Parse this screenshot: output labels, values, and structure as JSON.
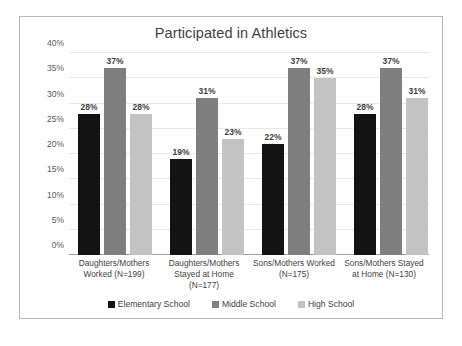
{
  "chart_data": {
    "type": "bar",
    "title": "Participated in Athletics",
    "xlabel": "",
    "ylabel": "",
    "ylim": [
      0,
      40
    ],
    "ytick_labels": [
      "40%",
      "35%",
      "30%",
      "25%",
      "20%",
      "15%",
      "10%",
      "5%",
      "0%"
    ],
    "ytick_values": [
      40,
      35,
      30,
      25,
      20,
      15,
      10,
      5,
      0
    ],
    "grid": true,
    "legend_position": "bottom",
    "categories": [
      "Daughters/Mothers Worked (N=199)",
      "Daughters/Mothers Stayed at Home (N=177)",
      "Sons/Mothers Worked (N=175)",
      "Sons/Mothers Stayed at Home (N=130)"
    ],
    "series": [
      {
        "name": "Elementary School",
        "color": "#131313",
        "values": [
          28,
          19,
          22,
          28
        ],
        "labels": [
          "28%",
          "19%",
          "22%",
          "28%"
        ]
      },
      {
        "name": "Middle School",
        "color": "#7f7f7f",
        "values": [
          37,
          31,
          37,
          37
        ],
        "labels": [
          "37%",
          "31%",
          "37%",
          "37%"
        ]
      },
      {
        "name": "High School",
        "color": "#c3c3c3",
        "values": [
          28,
          23,
          35,
          31
        ],
        "labels": [
          "28%",
          "23%",
          "35%",
          "31%"
        ]
      }
    ]
  }
}
